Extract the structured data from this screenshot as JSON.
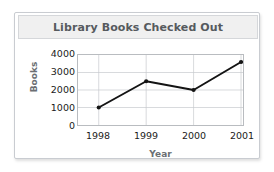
{
  "card": {
    "title": "Library Books Checked Out"
  },
  "chart_data": {
    "type": "line",
    "title": "Library Books Checked Out",
    "xlabel": "Year",
    "ylabel": "Books",
    "categories": [
      "1998",
      "1999",
      "2000",
      "2001"
    ],
    "values": [
      1000,
      2500,
      2000,
      3600
    ],
    "yticks": [
      "4000",
      "3000",
      "2000",
      "1000",
      "0"
    ],
    "ytick_values": [
      4000,
      3000,
      2000,
      1000,
      0
    ],
    "ylim": [
      0,
      4000
    ],
    "grid": true,
    "legend": "none",
    "marker": "circle",
    "line_color": "#141414"
  },
  "colors": {
    "title_text": "#565a5e",
    "axis_title": "#6b6f73",
    "tick_text": "#1b1b1b",
    "grid": "#c6c9cd",
    "titlebar_bg": "#f0f0f0",
    "card_border": "#c9ccd1"
  }
}
